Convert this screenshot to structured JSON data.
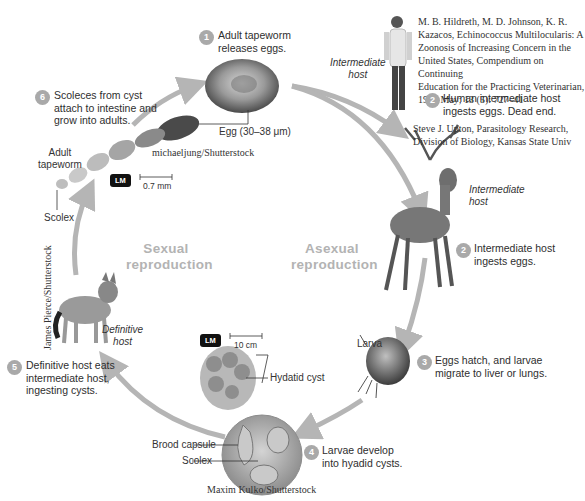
{
  "steps": [
    {
      "num": "1",
      "text_line1": "Adult tapeworm",
      "text_line2": "releases eggs."
    },
    {
      "num": "2",
      "text_line1": "Human intermediate host",
      "text_line2": "ingests eggs. Dead end."
    },
    {
      "num": "2",
      "text_line1": "Intermediate host",
      "text_line2": "ingests eggs."
    },
    {
      "num": "3",
      "text_line1": "Eggs hatch, and larvae",
      "text_line2": "migrate to liver or lungs."
    },
    {
      "num": "4",
      "text_line1": "Larvae develop",
      "text_line2": "into hyadid cysts."
    },
    {
      "num": "5",
      "text_line1": "Definitive host eats",
      "text_line2": "intermediate host,",
      "text_line3": "ingesting cysts."
    },
    {
      "num": "6",
      "text_line1": "Scoleces from cyst",
      "text_line2": "attach to intestine and",
      "text_line3": "grow into adults."
    }
  ],
  "labels": {
    "egg": "Egg (30–38 μm)",
    "adult_tapeworm_1": "Adult",
    "adult_tapeworm_2": "tapeworm",
    "scolex_top": "Scolex",
    "larva": "Larva",
    "hydatid_cyst": "Hydatid cyst",
    "brood_capsule": "Brood capsule",
    "scolex_bottom": "Scolex",
    "human_host_1": "Intermediate",
    "human_host_2": "host",
    "deer_host_1": "Intermediate",
    "deer_host_2": "host",
    "wolf_host_1": "Definitive",
    "wolf_host_2": "host"
  },
  "center": {
    "sexual_1": "Sexual",
    "sexual_2": "reproduction",
    "asexual_1": "Asexual",
    "asexual_2": "reproduction"
  },
  "scale_bars": {
    "top": {
      "badge": "LM",
      "value": "0.7 mm"
    },
    "bottom": {
      "badge": "LM",
      "value": "10 cm"
    }
  },
  "credits": {
    "tapeworm": "michaeljung/Shutterstock",
    "hildreth_1": "M. B. Hildreth, M. D. Johnson, K. R.",
    "hildreth_2": "Kazacos, Echinococcus Multilocularis: A",
    "hildreth_3": "Zoonosis of Increasing Concern in the",
    "hildreth_4": "United States, Compendium on Continuing",
    "hildreth_5": "Education for the Practicing Veterinarian,",
    "hildreth_6": "1991 May; 13 (5): 727–41",
    "upton_1": "Steve J. Upton, Parasitology Research,",
    "upton_2": "Division of Biology, Kansas State Univ",
    "wolf": "James Pierce/Shutterstock",
    "cyst": "Maxim Kulko/Shutterstock"
  },
  "colors": {
    "arrow": "#b5b5b5",
    "step_badge": "#a9a9a9",
    "center_text": "#b3b3b3"
  }
}
